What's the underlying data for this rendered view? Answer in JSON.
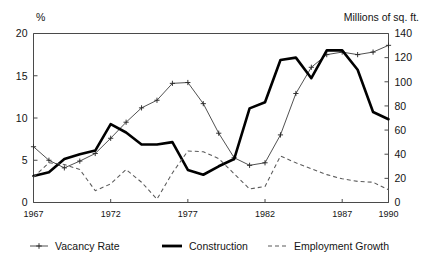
{
  "figure": {
    "left_axis_unit": "%",
    "right_axis_unit": "Millions of sq. ft."
  },
  "legend": {
    "items": [
      {
        "label": "Vacancy Rate",
        "marker": "line-with-plus-markers-icon"
      },
      {
        "label": "Construction",
        "marker": "thick-solid-line-icon"
      },
      {
        "label": "Employment Growth",
        "marker": "dashed-line-icon"
      }
    ]
  },
  "chart_data": {
    "type": "line",
    "title": "",
    "subtitle": "",
    "xlabel": "",
    "ylabel": "%",
    "y2label": "Millions of sq. ft.",
    "xlim": [
      1967,
      1990
    ],
    "ylim": [
      0,
      20
    ],
    "y2lim": [
      0,
      140
    ],
    "grid": false,
    "legend_position": "bottom",
    "x": [
      1967,
      1968,
      1969,
      1970,
      1971,
      1972,
      1973,
      1974,
      1975,
      1976,
      1977,
      1978,
      1979,
      1980,
      1981,
      1982,
      1983,
      1984,
      1985,
      1986,
      1987,
      1988,
      1989,
      1990
    ],
    "xticks": [
      1967,
      1972,
      1977,
      1982,
      1987,
      1990
    ],
    "xticklabels": [
      "1967",
      "1972",
      "1977",
      "1982",
      "1987",
      "1990"
    ],
    "yticks": [
      0,
      5,
      10,
      15,
      20
    ],
    "yticklabels": [
      "0",
      "5",
      "10",
      "15",
      "20"
    ],
    "y2ticks": [
      0,
      20,
      40,
      60,
      80,
      100,
      120,
      140
    ],
    "y2ticklabels": [
      "0",
      "20",
      "40",
      "60",
      "80",
      "100",
      "120",
      "140"
    ],
    "series": [
      {
        "name": "Vacancy Rate",
        "axis": "left",
        "style": "thin-line-plus-markers",
        "values": [
          6.6,
          5.0,
          4.1,
          4.9,
          5.8,
          7.6,
          9.5,
          11.2,
          12.1,
          14.1,
          14.2,
          11.7,
          8.2,
          5.3,
          4.4,
          4.7,
          8.0,
          12.9,
          16.0,
          17.5,
          17.8,
          17.5,
          17.8,
          18.6
        ]
      },
      {
        "name": "Construction",
        "axis": "right",
        "style": "thick-solid-line",
        "values": [
          22,
          25,
          36,
          40,
          43,
          65,
          58,
          48,
          48,
          50,
          27,
          23,
          30,
          36,
          78,
          83,
          118,
          120,
          103,
          126,
          126,
          110,
          75,
          69
        ]
      },
      {
        "name": "Employment Growth",
        "axis": "left",
        "style": "dashed-line",
        "values": [
          3.0,
          4.7,
          4.5,
          3.9,
          1.4,
          2.2,
          3.9,
          2.4,
          0.4,
          3.5,
          6.1,
          6.0,
          5.2,
          3.4,
          1.6,
          1.9,
          5.5,
          4.7,
          4.0,
          3.3,
          2.8,
          2.5,
          2.4,
          1.5
        ]
      }
    ]
  }
}
